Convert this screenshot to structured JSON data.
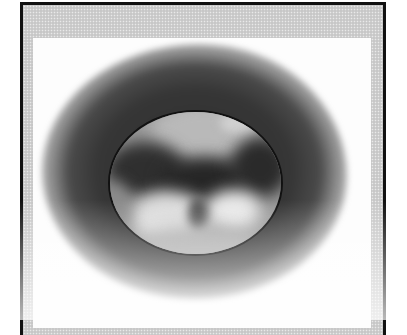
{
  "figure": {
    "colors": {
      "frame_border": "#111111",
      "frame_fill": "#cfcfcf",
      "panel": "#fdfdfd",
      "halo": "#2e2e2e",
      "planet_base": "#9a9a9a",
      "planet_dark": "#2a2a2a",
      "planet_light": "#e6e6e6"
    }
  }
}
